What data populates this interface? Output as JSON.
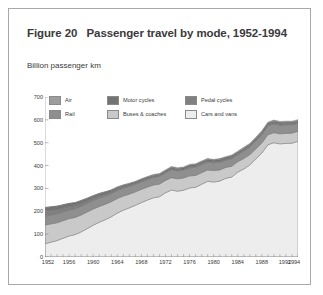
{
  "figure": {
    "title": "Figure 20   Passenger travel by mode, 1952-1994",
    "unit_label": "Billion passenger km"
  },
  "legend": {
    "items": [
      {
        "label": "Air",
        "color": "#9d9d9d",
        "icon": "legend-swatch-air"
      },
      {
        "label": "Motor cycles",
        "color": "#737373",
        "icon": "legend-swatch-motor-cycles"
      },
      {
        "label": "Pedal cycles",
        "color": "#808080",
        "icon": "legend-swatch-pedal-cycles"
      },
      {
        "label": "Rail",
        "color": "#8f8f8f",
        "icon": "legend-swatch-rail"
      },
      {
        "label": "Buses & coaches",
        "color": "#c9c9c9",
        "icon": "legend-swatch-buses-coaches"
      },
      {
        "label": "Cars and vans",
        "color": "#ededed",
        "icon": "legend-swatch-cars-and-vans"
      }
    ]
  },
  "chart_data": {
    "type": "area",
    "stacked": true,
    "title": "Figure 20   Passenger travel by mode, 1952-1994",
    "xlabel": "",
    "ylabel": "Billion passenger km",
    "ylim": [
      0,
      700
    ],
    "yticks": [
      0,
      100,
      200,
      300,
      400,
      500,
      600,
      700
    ],
    "xlim": [
      1952,
      1994
    ],
    "xticks": [
      1952,
      1956,
      1960,
      1964,
      1968,
      1972,
      1976,
      1980,
      1984,
      1988,
      1992,
      1994
    ],
    "xtick_labels": [
      "1952",
      "1956",
      "1960",
      "1964",
      "1968",
      "1972",
      "1976",
      "1980",
      "1984",
      "1988",
      "1992",
      "1994"
    ],
    "grid": false,
    "legend_position": "top-left-inside",
    "x": [
      1952,
      1953,
      1954,
      1955,
      1956,
      1957,
      1958,
      1959,
      1960,
      1961,
      1962,
      1963,
      1964,
      1965,
      1966,
      1967,
      1968,
      1969,
      1970,
      1971,
      1972,
      1973,
      1974,
      1975,
      1976,
      1977,
      1978,
      1979,
      1980,
      1981,
      1982,
      1983,
      1984,
      1985,
      1986,
      1987,
      1988,
      1989,
      1990,
      1991,
      1992,
      1993,
      1994
    ],
    "series": [
      {
        "name": "Cars and vans",
        "color": "#ededed",
        "values": [
          58,
          65,
          72,
          82,
          92,
          98,
          110,
          124,
          139,
          152,
          163,
          176,
          192,
          205,
          215,
          226,
          238,
          249,
          259,
          264,
          281,
          293,
          288,
          292,
          302,
          305,
          318,
          331,
          328,
          332,
          344,
          350,
          371,
          385,
          403,
          429,
          455,
          491,
          500,
          495,
          497,
          498,
          506
        ]
      },
      {
        "name": "Buses & coaches",
        "color": "#c9c9c9",
        "values": [
          82,
          80,
          78,
          77,
          76,
          75,
          74,
          73,
          71,
          69,
          68,
          66,
          64,
          62,
          60,
          59,
          58,
          57,
          56,
          55,
          54,
          54,
          54,
          54,
          53,
          52,
          51,
          50,
          50,
          49,
          48,
          47,
          46,
          46,
          45,
          44,
          44,
          44,
          44,
          44,
          44,
          44,
          44
        ]
      },
      {
        "name": "Rail",
        "color": "#8f8f8f",
        "values": [
          39,
          39,
          39,
          38,
          38,
          38,
          38,
          37,
          37,
          37,
          36,
          35,
          35,
          34,
          34,
          33,
          33,
          33,
          33,
          34,
          34,
          36,
          35,
          35,
          35,
          36,
          36,
          35,
          34,
          34,
          31,
          33,
          30,
          33,
          33,
          35,
          37,
          39,
          39,
          38,
          38,
          37,
          35
        ]
      },
      {
        "name": "Pedal cycles",
        "color": "#808080",
        "values": [
          23,
          21,
          19,
          17,
          15,
          14,
          13,
          12,
          11,
          10,
          9,
          8,
          7,
          6,
          6,
          5,
          5,
          5,
          5,
          4,
          4,
          4,
          4,
          4,
          5,
          5,
          5,
          5,
          5,
          5,
          5,
          5,
          5,
          5,
          5,
          5,
          5,
          5,
          5,
          5,
          5,
          5,
          5
        ]
      },
      {
        "name": "Motor cycles",
        "color": "#737373",
        "values": [
          14,
          14,
          14,
          14,
          13,
          12,
          11,
          10,
          9,
          9,
          8,
          7,
          6,
          6,
          5,
          5,
          5,
          5,
          4,
          4,
          4,
          5,
          5,
          5,
          6,
          6,
          6,
          6,
          6,
          7,
          7,
          7,
          6,
          6,
          6,
          6,
          6,
          6,
          6,
          6,
          5,
          5,
          5
        ]
      },
      {
        "name": "Air",
        "color": "#9d9d9d",
        "values": [
          1,
          1,
          1,
          1,
          1,
          1,
          2,
          2,
          2,
          2,
          2,
          2,
          3,
          3,
          3,
          3,
          3,
          3,
          4,
          4,
          4,
          4,
          4,
          4,
          4,
          4,
          4,
          4,
          4,
          4,
          4,
          4,
          5,
          5,
          5,
          5,
          5,
          5,
          5,
          5,
          5,
          5,
          6
        ]
      }
    ]
  }
}
